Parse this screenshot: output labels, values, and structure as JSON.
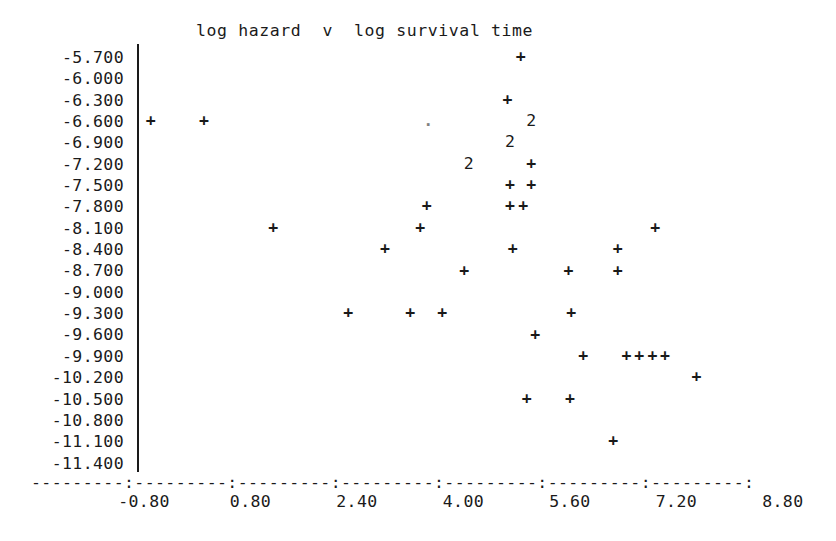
{
  "chart_data": {
    "type": "scatter",
    "title": "log hazard  v  log survival time",
    "xlabel": "",
    "ylabel": "",
    "grid": false,
    "legend": "none",
    "xlim": [
      -1.6,
      9.6
    ],
    "ylim": [
      -11.55,
      -5.55
    ],
    "x_ticks": [
      "-0.80",
      "0.80",
      "2.40",
      "4.00",
      "5.60",
      "7.20",
      "8.80"
    ],
    "x_tick_values": [
      -0.8,
      0.8,
      2.4,
      4.0,
      5.6,
      7.2,
      8.8
    ],
    "y_ticks": [
      "-5.700",
      "-6.000",
      "-6.300",
      "-6.600",
      "-6.900",
      "-7.200",
      "-7.500",
      "-7.800",
      "-8.100",
      "-8.400",
      "-8.700",
      "-9.000",
      "-9.300",
      "-9.600",
      "-9.900",
      "-10.200",
      "-10.500",
      "-10.800",
      "-11.100",
      "-11.400"
    ],
    "y_tick_values": [
      -5.7,
      -6.0,
      -6.3,
      -6.6,
      -6.9,
      -7.2,
      -7.5,
      -7.8,
      -8.1,
      -8.4,
      -8.7,
      -9.0,
      -9.3,
      -9.6,
      -9.9,
      -10.2,
      -10.5,
      -10.8,
      -11.1,
      -11.4
    ],
    "axis_rule": "---------:---------:---------:---------:---------:---------:---------:",
    "marker_legend": {
      "+": "single observation",
      "2": "two coincident observations",
      ".": "faint single observation"
    },
    "points": [
      {
        "x": -0.7,
        "y": -6.6,
        "glyph": "+",
        "count": 1
      },
      {
        "x": 0.1,
        "y": -6.6,
        "glyph": "+",
        "count": 1
      },
      {
        "x": 3.47,
        "y": -6.6,
        "glyph": ".",
        "count": 1
      },
      {
        "x": 5.02,
        "y": -6.6,
        "glyph": "2",
        "count": 2
      },
      {
        "x": 4.7,
        "y": -6.9,
        "glyph": "2",
        "count": 2
      },
      {
        "x": 4.08,
        "y": -7.2,
        "glyph": "2",
        "count": 2
      },
      {
        "x": 5.02,
        "y": -7.2,
        "glyph": "+",
        "count": 1
      },
      {
        "x": 4.7,
        "y": -7.5,
        "glyph": "+",
        "count": 1
      },
      {
        "x": 5.02,
        "y": -7.5,
        "glyph": "+",
        "count": 1
      },
      {
        "x": 3.45,
        "y": -7.8,
        "glyph": "+",
        "count": 1
      },
      {
        "x": 4.7,
        "y": -7.8,
        "glyph": "+",
        "count": 1
      },
      {
        "x": 4.9,
        "y": -7.8,
        "glyph": "+",
        "count": 1
      },
      {
        "x": 1.14,
        "y": -8.1,
        "glyph": "+",
        "count": 1
      },
      {
        "x": 3.35,
        "y": -8.1,
        "glyph": "+",
        "count": 1
      },
      {
        "x": 6.88,
        "y": -8.1,
        "glyph": "+",
        "count": 1
      },
      {
        "x": 2.82,
        "y": -8.4,
        "glyph": "+",
        "count": 1
      },
      {
        "x": 4.74,
        "y": -8.4,
        "glyph": "+",
        "count": 1
      },
      {
        "x": 6.32,
        "y": -8.4,
        "glyph": "+",
        "count": 1
      },
      {
        "x": 4.01,
        "y": -8.7,
        "glyph": "+",
        "count": 1
      },
      {
        "x": 5.58,
        "y": -8.7,
        "glyph": "+",
        "count": 1
      },
      {
        "x": 6.32,
        "y": -8.7,
        "glyph": "+",
        "count": 1
      },
      {
        "x": 2.27,
        "y": -9.3,
        "glyph": "+",
        "count": 1
      },
      {
        "x": 3.2,
        "y": -9.3,
        "glyph": "+",
        "count": 1
      },
      {
        "x": 3.68,
        "y": -9.3,
        "glyph": "+",
        "count": 1
      },
      {
        "x": 5.62,
        "y": -9.3,
        "glyph": "+",
        "count": 1
      },
      {
        "x": 5.08,
        "y": -9.6,
        "glyph": "+",
        "count": 1
      },
      {
        "x": 5.8,
        "y": -9.9,
        "glyph": "+",
        "count": 1
      },
      {
        "x": 6.45,
        "y": -9.9,
        "glyph": "+",
        "count": 1
      },
      {
        "x": 6.64,
        "y": -9.9,
        "glyph": "+",
        "count": 1
      },
      {
        "x": 6.84,
        "y": -9.9,
        "glyph": "+",
        "count": 1
      },
      {
        "x": 7.03,
        "y": -9.9,
        "glyph": "+",
        "count": 1
      },
      {
        "x": 7.5,
        "y": -10.2,
        "glyph": "+",
        "count": 1
      },
      {
        "x": 4.95,
        "y": -10.5,
        "glyph": "+",
        "count": 1
      },
      {
        "x": 5.6,
        "y": -10.5,
        "glyph": "+",
        "count": 1
      },
      {
        "x": 6.25,
        "y": -11.1,
        "glyph": "+",
        "count": 1
      },
      {
        "x": 4.86,
        "y": -5.7,
        "glyph": "+",
        "count": 1
      },
      {
        "x": 4.66,
        "y": -6.3,
        "glyph": "+",
        "count": 1
      }
    ]
  },
  "colors": {
    "ink": "#1a1a1a",
    "background": "#ffffff"
  }
}
